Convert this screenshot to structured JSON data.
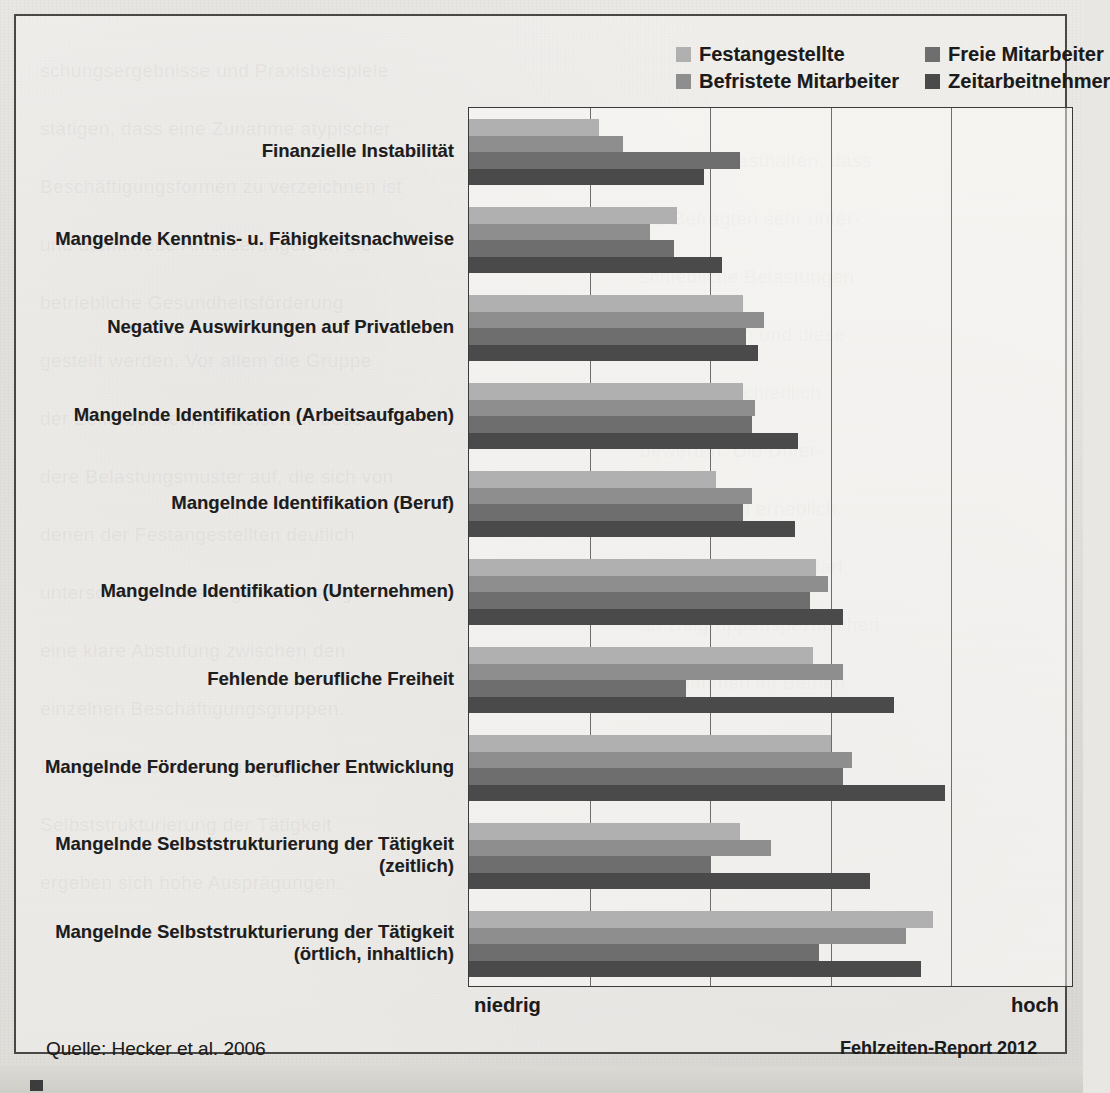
{
  "figure": {
    "source_note": "Quelle: Hecker et al. 2006",
    "report_note": "Fehlzeiten-Report 2012"
  },
  "axis": {
    "low_label": "niedrig",
    "high_label": "hoch"
  },
  "legend": {
    "items": [
      {
        "label": "Festangestellte",
        "color": "#b0b0b0"
      },
      {
        "label": "Freie Mitarbeiter",
        "color": "#6e6e6e"
      },
      {
        "label": "Befristete Mitarbeiter",
        "color": "#8e8e8e"
      },
      {
        "label": "Zeitarbeitnehmer",
        "color": "#4a4a4a"
      }
    ]
  },
  "chart_data": {
    "type": "bar",
    "orientation": "horizontal",
    "title": "",
    "xlabel": "",
    "ylabel": "",
    "xlim": [
      0,
      1
    ],
    "xtick_labels": [
      "niedrig",
      "hoch"
    ],
    "grid": true,
    "gridline_fractions": [
      0.2,
      0.4,
      0.6,
      0.8
    ],
    "legend_position": "top-right",
    "categories": [
      "Finanzielle Instabilität",
      "Mangelnde Kenntnis- u. Fähigkeitsnachweise",
      "Negative Auswirkungen auf Privatleben",
      "Mangelnde Identifikation (Arbeitsaufgaben)",
      "Mangelnde Identifikation (Beruf)",
      "Mangelnde Identifikation (Unternehmen)",
      "Fehlende berufliche Freiheit",
      "Mangelnde Förderung beruflicher Entwicklung",
      "Mangelnde Selbststrukturierung der Tätigkeit (zeitlich)",
      "Mangelnde Selbststrukturierung der Tätigkeit (örtlich, inhaltlich)"
    ],
    "category_lines": [
      [
        "Finanzielle Instabilität"
      ],
      [
        "Mangelnde Kenntnis- u. Fähigkeitsnachweise"
      ],
      [
        "Negative Auswirkungen auf Privatleben"
      ],
      [
        "Mangelnde Identifikation (Arbeitsaufgaben)"
      ],
      [
        "Mangelnde Identifikation (Beruf)"
      ],
      [
        "Mangelnde Identifikation (Unternehmen)"
      ],
      [
        "Fehlende berufliche Freiheit"
      ],
      [
        "Mangelnde Förderung beruflicher Entwicklung"
      ],
      [
        "Mangelnde Selbststrukturierung der Tätigkeit",
        "(zeitlich)"
      ],
      [
        "Mangelnde Selbststrukturierung der Tätigkeit",
        "(örtlich, inhaltlich)"
      ]
    ],
    "series": [
      {
        "name": "Festangestellte",
        "color": "#b0b0b0",
        "values": [
          0.215,
          0.345,
          0.455,
          0.455,
          0.41,
          0.575,
          0.57,
          0.6,
          0.45,
          0.77
        ]
      },
      {
        "name": "Befristete Mitarbeiter",
        "color": "#8e8e8e",
        "values": [
          0.255,
          0.3,
          0.49,
          0.475,
          0.47,
          0.595,
          0.62,
          0.635,
          0.5,
          0.725
        ]
      },
      {
        "name": "Freie Mitarbeiter",
        "color": "#6e6e6e",
        "values": [
          0.45,
          0.34,
          0.46,
          0.47,
          0.455,
          0.565,
          0.36,
          0.62,
          0.4,
          0.58
        ]
      },
      {
        "name": "Zeitarbeitnehmer",
        "color": "#4a4a4a",
        "values": [
          0.39,
          0.42,
          0.48,
          0.545,
          0.54,
          0.62,
          0.705,
          0.79,
          0.665,
          0.75
        ]
      }
    ]
  },
  "ghost_text": [
    {
      "x": 40,
      "y": 60,
      "text": "schungsergebnisse und Praxisbeispiele"
    },
    {
      "x": 40,
      "y": 118,
      "text": "stätigen, dass eine Zunahme atypischer"
    },
    {
      "x": 40,
      "y": 176,
      "text": "Beschäftigungsformen zu verzeichnen ist"
    },
    {
      "x": 40,
      "y": 234,
      "text": "und damit neue Anforderungen an die"
    },
    {
      "x": 40,
      "y": 292,
      "text": "betriebliche Gesundheitsförderung"
    },
    {
      "x": 40,
      "y": 350,
      "text": "gestellt werden. Vor allem die Gruppe"
    },
    {
      "x": 40,
      "y": 408,
      "text": "der Zeitarbeitnehmer weist hier beson-"
    },
    {
      "x": 40,
      "y": 466,
      "text": "dere Belastungsmuster auf, die sich von"
    },
    {
      "x": 40,
      "y": 524,
      "text": "denen der Festangestellten deutlich"
    },
    {
      "x": 40,
      "y": 582,
      "text": "unterscheiden. Die Ergebnisse zeigen"
    },
    {
      "x": 40,
      "y": 640,
      "text": "eine klare Abstufung zwischen den"
    },
    {
      "x": 40,
      "y": 698,
      "text": "einzelnen Beschäftigungsgruppen."
    },
    {
      "x": 40,
      "y": 756,
      "text": "Insbesondere bei der mangelnden"
    },
    {
      "x": 40,
      "y": 814,
      "text": "Selbststrukturierung der Tätigkeit"
    },
    {
      "x": 40,
      "y": 872,
      "text": "ergeben sich hohe Ausprägungen."
    },
    {
      "x": 640,
      "y": 150,
      "text": "kann man festhalten, dass"
    },
    {
      "x": 640,
      "y": 208,
      "text": "die Befragten sehr unter-"
    },
    {
      "x": 640,
      "y": 266,
      "text": "schiedliche Belastungen"
    },
    {
      "x": 640,
      "y": 324,
      "text": "wahrnehmen und diese"
    },
    {
      "x": 640,
      "y": 382,
      "text": "auch unterschiedlich"
    },
    {
      "x": 640,
      "y": 440,
      "text": "bewerten. Die Unter-"
    },
    {
      "x": 640,
      "y": 498,
      "text": "schiede sind erheblich."
    },
    {
      "x": 640,
      "y": 556,
      "text": "Daraus folgt ein Bedarf"
    },
    {
      "x": 640,
      "y": 614,
      "text": "an zielgruppenspezifischen"
    },
    {
      "x": 640,
      "y": 672,
      "text": "Maßnahmen im Betrieb."
    }
  ]
}
